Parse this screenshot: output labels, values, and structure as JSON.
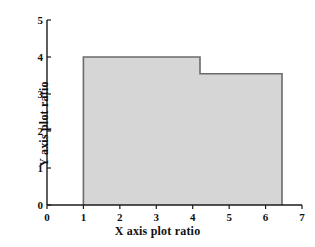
{
  "chart_data": {
    "type": "area",
    "title": "",
    "xlabel": "X axis plot ratio",
    "ylabel": "Y axis plot ratio",
    "xlim": [
      0,
      7
    ],
    "ylim": [
      0,
      5
    ],
    "xticks": [
      "0",
      "1",
      "2",
      "3",
      "4",
      "5",
      "6",
      "7"
    ],
    "yticks": [
      "0",
      "1",
      "2",
      "3",
      "4",
      "5"
    ],
    "xtick_values": [
      0,
      1,
      2,
      3,
      4,
      5,
      6,
      7
    ],
    "ytick_values": [
      0,
      1,
      2,
      3,
      4,
      5
    ],
    "grid": false,
    "legend": null,
    "steps": [
      {
        "x_start": 1.0,
        "x_end": 4.2,
        "y": 4.0
      },
      {
        "x_start": 4.2,
        "x_end": 6.45,
        "y": 3.55
      }
    ],
    "x": [
      1.0,
      4.2,
      4.2,
      6.45
    ],
    "values": [
      4.0,
      4.0,
      3.55,
      3.55
    ],
    "fill_color": "#d6d6d6",
    "line_color": "#6b6b6b",
    "axis_color": "#1a1a1a",
    "background": "#ffffff"
  }
}
